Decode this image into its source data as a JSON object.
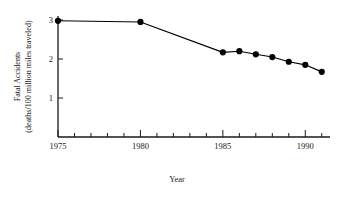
{
  "chart_data": {
    "type": "line",
    "title": "",
    "xlabel": "Year",
    "ylabel": "Fatal Accidents (deaths/100 million miles traveled)",
    "ylabel_line1": "Fatal Accidents",
    "ylabel_line2": "(deaths/100 million miles traveled)",
    "x": [
      1975,
      1980,
      1985,
      1986,
      1987,
      1988,
      1989,
      1990,
      1991
    ],
    "values": [
      2.98,
      2.95,
      2.17,
      2.2,
      2.12,
      2.05,
      1.93,
      1.85,
      1.67
    ],
    "series": [
      {
        "name": "Fatal Accidents",
        "values": [
          2.98,
          2.95,
          2.17,
          2.2,
          2.12,
          2.05,
          1.93,
          1.85,
          1.67
        ]
      }
    ],
    "xlim": [
      1975,
      1991.5
    ],
    "ylim": [
      0,
      3.1
    ],
    "xticks": [
      1975,
      1976,
      1977,
      1978,
      1979,
      1980,
      1981,
      1982,
      1983,
      1984,
      1985,
      1986,
      1987,
      1988,
      1989,
      1990,
      1991
    ],
    "xtick_labels": [
      "1975",
      "1980",
      "1985",
      "1990"
    ],
    "xtick_label_values": [
      1975,
      1980,
      1985,
      1990
    ],
    "yticks": [
      1,
      2,
      3
    ],
    "ytick_labels": [
      "1",
      "2",
      "3"
    ],
    "grid": false,
    "legend": false,
    "legend_position": "none",
    "marker": "filled-circle",
    "line_color": "#000000",
    "marker_color": "#000000",
    "axis_color": "#1a1a1a",
    "background_color": "#ffffff"
  }
}
